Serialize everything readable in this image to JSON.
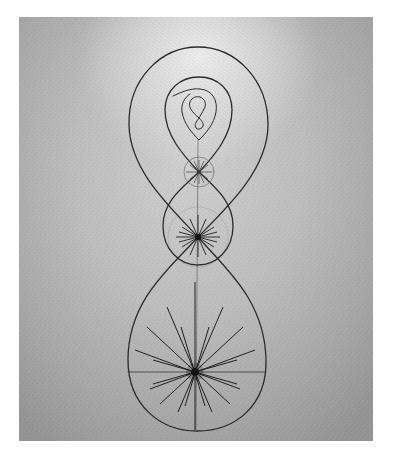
{
  "image": {
    "description": "Photograph of a drawing: nested figure-eight curves converging downward with star-burst points on a gray paper background",
    "background_color_center": "#cfcfcf",
    "background_color_edge": "#959595",
    "line_color": "#2a2a2a",
    "frame_color": "#ffffff"
  },
  "drawing": {
    "figure_eights": [
      {
        "name": "outer",
        "top_y": 47,
        "crossing": [
          198,
          237
        ],
        "bottom_y": 431
      },
      {
        "name": "middle",
        "top_y": 77,
        "crossing": [
          199,
          172
        ],
        "bottom_y": 265
      },
      {
        "name": "inner",
        "top_y": 100,
        "crossing": [
          199,
          118
        ],
        "bottom_y": 128
      }
    ],
    "star_bursts": [
      {
        "name": "large",
        "center": [
          195,
          372
        ],
        "rays": 16
      },
      {
        "name": "medium",
        "center": [
          198,
          237
        ],
        "rays": 14
      },
      {
        "name": "small",
        "center": [
          199,
          172
        ],
        "rays": 10
      }
    ]
  }
}
